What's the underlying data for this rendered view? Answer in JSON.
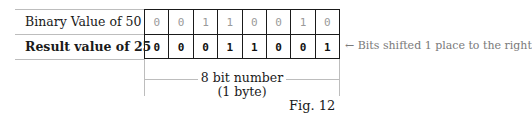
{
  "rows": [
    {
      "label": "Binary Value of 50",
      "bold": false,
      "bits": [
        "0",
        "0",
        "1",
        "1",
        "0",
        "0",
        "1",
        "0"
      ]
    },
    {
      "label": "Result value of 25",
      "bold": true,
      "bits": [
        "0",
        "0",
        "0",
        "1",
        "1",
        "0",
        "0",
        "1"
      ]
    }
  ],
  "annotation": {
    "arrow": "←",
    "text": "Bits shifted 1 place to the right",
    "icon": "left-arrow-icon"
  },
  "span": {
    "line1": "8 bit number",
    "line2": "(1 byte)"
  },
  "caption": "Fig. 12",
  "colors": {
    "grid": "#1a1a1a",
    "rule": "#bdbdbd",
    "faint_bits": "#9a9a9a",
    "annotation": "#7a7a7a"
  }
}
